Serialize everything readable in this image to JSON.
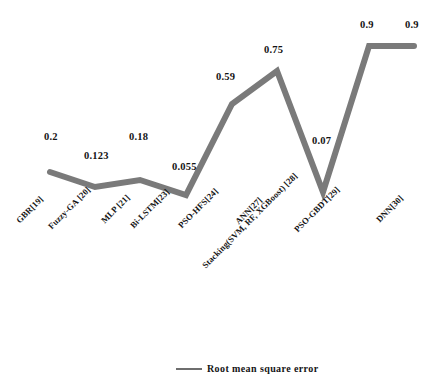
{
  "chart_data": {
    "type": "line",
    "title": "",
    "xlabel": "",
    "ylabel": "",
    "grid": false,
    "legend_position": "bottom-center",
    "line_color": "#7a7a7a",
    "line_width": 6,
    "categories": [
      "GBR[19]",
      "Fuzzy-GA [20]",
      "MLP [21]",
      "Bi-LSTM[23]",
      "PSO-HFS[24]",
      "ANN[27]",
      "Stacking(SVM, RF, XGBoost) [28]",
      "PSO-GBDT[29]",
      "DNN[30]"
    ],
    "series": [
      {
        "name": "Root mean square error",
        "values": [
          0.2,
          0.123,
          0.18,
          0.055,
          0.59,
          0.75,
          0.07,
          0.9,
          0.9
        ],
        "value_labels": [
          "0.2",
          "0.123",
          "0.18",
          "0.055",
          "0.59",
          "0.75",
          "0.07",
          "0.9",
          "0.9"
        ]
      }
    ],
    "points_px": [
      {
        "x": 50,
        "y": 172
      },
      {
        "x": 95,
        "y": 187
      },
      {
        "x": 140,
        "y": 180
      },
      {
        "x": 186,
        "y": 195
      },
      {
        "x": 232,
        "y": 104
      },
      {
        "x": 277,
        "y": 71
      },
      {
        "x": 323,
        "y": 192
      },
      {
        "x": 369,
        "y": 46
      },
      {
        "x": 414,
        "y": 46
      }
    ],
    "value_label_positions_px": [
      {
        "x": 44,
        "y": 131
      },
      {
        "x": 84,
        "y": 150
      },
      {
        "x": 129,
        "y": 131
      },
      {
        "x": 172,
        "y": 161
      },
      {
        "x": 216,
        "y": 71
      },
      {
        "x": 264,
        "y": 44
      },
      {
        "x": 312,
        "y": 135
      },
      {
        "x": 360,
        "y": 19
      },
      {
        "x": 405,
        "y": 19
      }
    ],
    "x_label_positions_px": [
      {
        "x": 14,
        "y": 218
      },
      {
        "x": 46,
        "y": 224
      },
      {
        "x": 99,
        "y": 218
      },
      {
        "x": 128,
        "y": 223
      },
      {
        "x": 176,
        "y": 223
      },
      {
        "x": 233,
        "y": 219
      },
      {
        "x": 200,
        "y": 263
      },
      {
        "x": 292,
        "y": 227
      },
      {
        "x": 374,
        "y": 217
      }
    ],
    "legend": {
      "label": "Root mean square error",
      "swatch_color": "#6e6e6e"
    }
  }
}
